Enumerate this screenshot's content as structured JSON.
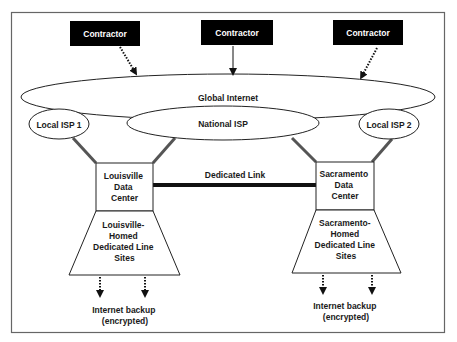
{
  "diagram": {
    "contractors": [
      {
        "label": "Contractor",
        "arrow": "dotted"
      },
      {
        "label": "Contractor",
        "arrow": "solid"
      },
      {
        "label": "Contractor",
        "arrow": "dotted"
      }
    ],
    "global_internet": {
      "label": "Global Internet"
    },
    "national_isp": {
      "label": "National ISP"
    },
    "local_isp_1": {
      "label": "Local ISP 1"
    },
    "local_isp_2": {
      "label": "Local ISP 2"
    },
    "louisville_dc": {
      "lines": [
        "Louisville",
        "Data",
        "Center"
      ]
    },
    "sacramento_dc": {
      "lines": [
        "Sacramento",
        "Data",
        "Center"
      ]
    },
    "dedicated_link": {
      "label": "Dedicated Link"
    },
    "louisville_sites": {
      "lines": [
        "Louisville-",
        "Homed",
        "Dedicated Line",
        "Sites"
      ]
    },
    "sacramento_sites": {
      "lines": [
        "Sacramento-",
        "Homed",
        "Dedicated Line",
        "Sites"
      ]
    },
    "louisville_backup": {
      "lines": [
        "Internet backup",
        "(encrypted)"
      ]
    },
    "sacramento_backup": {
      "lines": [
        "Internet backup",
        "(encrypted)"
      ]
    },
    "colors": {
      "frame": "#666666",
      "contractor_fill": "#000000",
      "connector": "#555555",
      "line": "#1a1a1a"
    }
  }
}
